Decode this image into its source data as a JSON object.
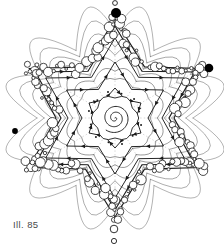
{
  "page": {
    "background_color": "#ffffff",
    "width": 224,
    "height": 247
  },
  "caption": {
    "text": "Ill. 85",
    "color": "#4a4a4a"
  },
  "figure": {
    "name": "six-pointed-star-snowflake-mandala",
    "stroke_color": "#1a1a1a",
    "fill_color": "#ffffff",
    "accent_color": "#000000",
    "center": {
      "x": 115,
      "y": 118
    },
    "points": 6,
    "rotation_deg": -90,
    "rings": [
      {
        "name": "inner-rosette",
        "outer_radius": 30,
        "inner_radius": 21,
        "arrow_count": 12
      },
      {
        "name": "mid-star-ring",
        "outer_radius": 56,
        "inner_radius": 33,
        "arrow_count": 12
      },
      {
        "name": "outer-star-ring",
        "outer_radius": 80,
        "inner_radius": 47,
        "arrow_count": 12
      },
      {
        "name": "star-outline-inner",
        "outer_radius": 92,
        "inner_radius": 54,
        "arrow_count": 12
      },
      {
        "name": "star-outline-outer",
        "outer_radius": 99,
        "inner_radius": 59,
        "arrow_count": 0
      }
    ],
    "spiral": {
      "name": "center-spiral",
      "turns": 2.6,
      "max_radius": 15
    },
    "filled_dots": [
      {
        "name": "top-filled-dot",
        "x": 116,
        "y": 13,
        "r": 5.0
      },
      {
        "name": "right-filled-dot",
        "x": 209,
        "y": 68,
        "r": 4.3
      },
      {
        "name": "left-filled-dot",
        "x": 15,
        "y": 131,
        "r": 2.9
      }
    ],
    "accent_open_circles": [
      {
        "name": "top-open-circle",
        "x": 115,
        "y": 3,
        "r": 2.4
      },
      {
        "name": "bottom-open-circle-outer",
        "x": 114,
        "y": 241,
        "r": 2.6
      },
      {
        "name": "bottom-open-circle-inner",
        "x": 114,
        "y": 229,
        "r": 3.8
      }
    ],
    "perimeter_circles": {
      "name": "perimeter-open-circles",
      "count": 150,
      "radius_range": [
        1.2,
        5.2
      ]
    }
  }
}
